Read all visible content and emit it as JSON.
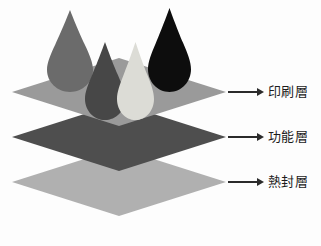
{
  "diagram": {
    "background_color": "#fdfdfd",
    "layers": [
      {
        "id": "printing-layer",
        "label": "印刷層",
        "color": "#9a9a9a",
        "order": 1,
        "position": "top",
        "center_x": 119,
        "center_y": 92,
        "half_width": 107,
        "half_height": 34
      },
      {
        "id": "functional-layer",
        "label": "功能層",
        "color": "#4e4e4e",
        "order": 2,
        "position": "middle",
        "center_x": 119,
        "center_y": 137,
        "half_width": 107,
        "half_height": 34
      },
      {
        "id": "heat-seal-layer",
        "label": "熱封層",
        "color": "#b0b0b0",
        "order": 3,
        "position": "bottom",
        "center_x": 119,
        "center_y": 182,
        "half_width": 107,
        "half_height": 34
      }
    ],
    "droplets": [
      {
        "id": "droplet-1",
        "color": "#6b6b6b",
        "tip_x": 70,
        "tip_y": 10,
        "width": 46,
        "height": 82
      },
      {
        "id": "droplet-2",
        "color": "#474747",
        "tip_x": 105,
        "tip_y": 42,
        "width": 40,
        "height": 78
      },
      {
        "id": "droplet-3",
        "color": "#dcdcd6",
        "tip_x": 136,
        "tip_y": 42,
        "width": 37,
        "height": 78
      },
      {
        "id": "droplet-4",
        "color": "#0d0d0d",
        "tip_x": 170,
        "tip_y": 8,
        "width": 43,
        "height": 84
      }
    ],
    "callouts": [
      {
        "id": "callout-printing",
        "label": "印刷層",
        "arrow": "arrow-right-icon",
        "target": "printing-layer"
      },
      {
        "id": "callout-functional",
        "label": "功能層",
        "arrow": "arrow-right-icon",
        "target": "functional-layer"
      },
      {
        "id": "callout-heatseal",
        "label": "熱封層",
        "arrow": "arrow-right-icon",
        "target": "heat-seal-layer"
      }
    ],
    "arrow_color": "#2b2b2b",
    "text_color": "#1c1c1c"
  }
}
